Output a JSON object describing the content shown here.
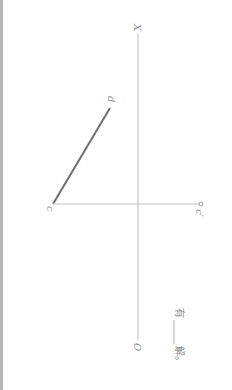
{
  "diagram": {
    "orientation": "rotated 90° clockwise",
    "labels": {
      "axis_start": "X",
      "axis_end": "O",
      "point_d": "d",
      "point_c": "c",
      "point_c_prime": "c′"
    },
    "caption": {
      "prefix": "有",
      "blank": "____",
      "suffix": "解。"
    },
    "colors": {
      "axis": "#bdbdbd",
      "segment": "#707070",
      "projector": "#c4c4c4",
      "text": "#8a8a8a",
      "border": "#b5b5b5"
    }
  }
}
